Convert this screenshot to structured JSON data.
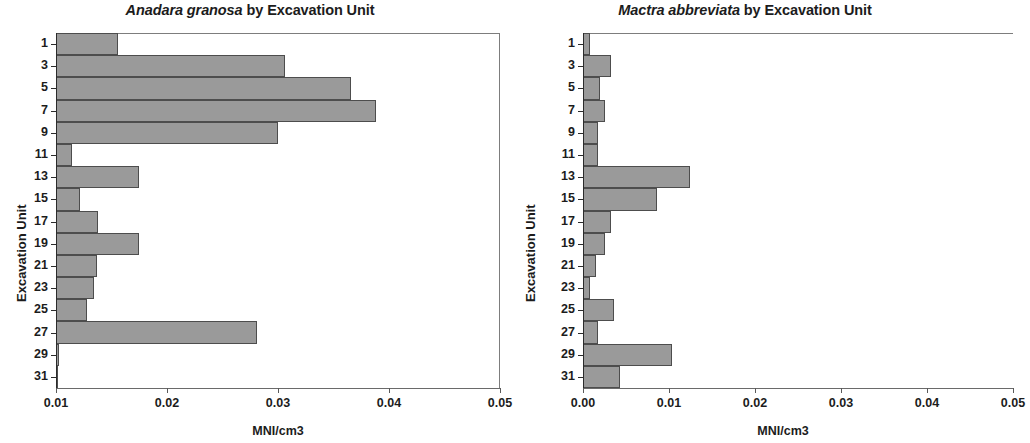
{
  "figure": {
    "panels": [
      {
        "id": "anadara-granosa",
        "title_species": "Anadara granosa",
        "title_rest": " by Excavation Unit",
        "xlabel": "MNI/cm3",
        "ylabel": "Excavation Unit"
      },
      {
        "id": "mactra-abbreviata",
        "title_species": "Mactra abbreviata",
        "title_rest": " by Excavation Unit",
        "xlabel": "MNI/cm3",
        "ylabel": "Excavation Unit"
      }
    ]
  },
  "colors": {
    "bar_fill": "#9a9a9a",
    "bar_edge": "#4d4d4d",
    "axis": "#2b2b2b",
    "frame": "#7d7d7d",
    "text": "#1c1c1c",
    "background": "#ffffff"
  },
  "chart_data": [
    {
      "type": "bar",
      "orientation": "horizontal",
      "title": "Anadara granosa by Excavation Unit",
      "xlabel": "MNI/cm3",
      "ylabel": "Excavation Unit",
      "xlim": [
        0.01,
        0.05
      ],
      "xticks": [
        0.01,
        0.02,
        0.03,
        0.04,
        0.05
      ],
      "xticklabels": [
        "0.01",
        "0.02",
        "0.03",
        "0.04",
        "0.05"
      ],
      "yticks": [
        1,
        3,
        5,
        7,
        9,
        11,
        13,
        15,
        17,
        19,
        21,
        23,
        25,
        27,
        29,
        31
      ],
      "yticklabels": [
        "1",
        "3",
        "5",
        "7",
        "9",
        "11",
        "13",
        "15",
        "17",
        "19",
        "21",
        "23",
        "25",
        "27",
        "29",
        "31"
      ],
      "grid": false,
      "legend": null,
      "categories": [
        1,
        3,
        5,
        7,
        9,
        11,
        13,
        15,
        17,
        19,
        21,
        23,
        25,
        27,
        29,
        31
      ],
      "values": [
        0.0156,
        0.0306,
        0.0366,
        0.0388,
        0.03,
        0.0114,
        0.0175,
        0.0122,
        0.0138,
        0.0175,
        0.0137,
        0.0134,
        0.0128,
        0.0281,
        0.0103,
        0.01
      ]
    },
    {
      "type": "bar",
      "orientation": "horizontal",
      "title": "Mactra abbreviata by Excavation Unit",
      "xlabel": "MNI/cm3",
      "ylabel": "Excavation Unit",
      "xlim": [
        0.0,
        0.05
      ],
      "xticks": [
        0.0,
        0.01,
        0.02,
        0.03,
        0.04,
        0.05
      ],
      "xticklabels": [
        "0.00",
        "0.01",
        "0.02",
        "0.03",
        "0.04",
        "0.05"
      ],
      "yticks": [
        1,
        3,
        5,
        7,
        9,
        11,
        13,
        15,
        17,
        19,
        21,
        23,
        25,
        27,
        29,
        31
      ],
      "yticklabels": [
        "1",
        "3",
        "5",
        "7",
        "9",
        "11",
        "13",
        "15",
        "17",
        "19",
        "21",
        "23",
        "25",
        "27",
        "29",
        "31"
      ],
      "grid": false,
      "legend": null,
      "categories": [
        1,
        3,
        5,
        7,
        9,
        11,
        13,
        15,
        17,
        19,
        21,
        23,
        25,
        27,
        29,
        31
      ],
      "values": [
        0.0008,
        0.0033,
        0.002,
        0.0026,
        0.0018,
        0.0017,
        0.0124,
        0.0086,
        0.0032,
        0.0026,
        0.0015,
        0.0008,
        0.0036,
        0.0018,
        0.0103,
        0.0043
      ]
    }
  ]
}
